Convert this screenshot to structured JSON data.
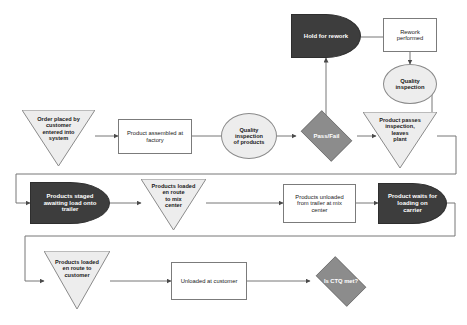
{
  "diagram": {
    "type": "process-flowchart",
    "background_color": "#ffffff",
    "palette": {
      "dark_fill": "#3d3d3d",
      "dark_text": "#ffffff",
      "mid_gray_fill": "#8c8c8c",
      "light_fill": "#ededed",
      "white_fill": "#ffffff",
      "line_color": "#767676",
      "text_color": "#1a1a1a"
    },
    "nodes": [
      {
        "id": "order-placed",
        "label": "Order placed by\ncustomer\nentered into\nsystem",
        "shape": "inverted-triangle",
        "fill": "#ededed"
      },
      {
        "id": "product-assembled",
        "label": "Product assembled at\nfactory",
        "shape": "rectangle",
        "fill": "#ffffff"
      },
      {
        "id": "quality-inspection-products",
        "label": "Quality\ninspection\nof products",
        "shape": "ellipse",
        "fill": "#ededed"
      },
      {
        "id": "pass-fail",
        "label": "Pass/Fail",
        "shape": "diamond",
        "fill": "#8c8c8c"
      },
      {
        "id": "hold-for-rework",
        "label": "Hold for rework",
        "shape": "d-terminator",
        "fill": "#3d3d3d"
      },
      {
        "id": "rework-performed",
        "label": "Rework\nperformed",
        "shape": "rectangle",
        "fill": "#ffffff"
      },
      {
        "id": "quality-inspection",
        "label": "Quality\ninspection",
        "shape": "ellipse",
        "fill": "#ededed"
      },
      {
        "id": "product-passes-inspection",
        "label": "Product passes\ninspection,\nleaves\nplant",
        "shape": "inverted-triangle",
        "fill": "#ededed"
      },
      {
        "id": "products-staged",
        "label": "Products staged\nawaiting load onto\ntrailer",
        "shape": "d-terminator",
        "fill": "#3d3d3d"
      },
      {
        "id": "products-loaded-mix-center",
        "label": "Products loaded\nen route\nto mix\ncenter",
        "shape": "inverted-triangle",
        "fill": "#ededed"
      },
      {
        "id": "products-unloaded-mix-center",
        "label": "Products unloaded\nfrom trailer at mix\ncenter",
        "shape": "rectangle",
        "fill": "#ffffff"
      },
      {
        "id": "product-waits-carrier",
        "label": "Product waits for\nloading on\ncarrier",
        "shape": "d-terminator",
        "fill": "#3d3d3d"
      },
      {
        "id": "products-loaded-customer",
        "label": "Products loaded\nen route to\ncustomer",
        "shape": "inverted-triangle",
        "fill": "#ededed"
      },
      {
        "id": "unloaded-at-customer",
        "label": "Unloaded at customer",
        "shape": "rectangle",
        "fill": "#ffffff"
      },
      {
        "id": "is-ctq-met",
        "label": "Is CTQ met?",
        "shape": "diamond",
        "fill": "#8c8c8c"
      }
    ],
    "edges": [
      {
        "from": "order-placed",
        "to": "product-assembled",
        "arrow": true
      },
      {
        "from": "product-assembled",
        "to": "quality-inspection-products",
        "arrow": false
      },
      {
        "from": "quality-inspection-products",
        "to": "pass-fail",
        "arrow": true
      },
      {
        "from": "pass-fail",
        "to": "hold-for-rework",
        "arrow": true
      },
      {
        "from": "hold-for-rework",
        "to": "rework-performed",
        "arrow": false
      },
      {
        "from": "rework-performed",
        "to": "quality-inspection",
        "arrow": true
      },
      {
        "from": "quality-inspection",
        "to": "product-passes-inspection",
        "arrow": false
      },
      {
        "from": "pass-fail",
        "to": "product-passes-inspection",
        "arrow": true
      },
      {
        "from": "product-passes-inspection",
        "to": "products-staged",
        "arrow": true
      },
      {
        "from": "products-staged",
        "to": "products-loaded-mix-center",
        "arrow": true
      },
      {
        "from": "products-loaded-mix-center",
        "to": "products-unloaded-mix-center",
        "arrow": true
      },
      {
        "from": "products-unloaded-mix-center",
        "to": "product-waits-carrier",
        "arrow": true
      },
      {
        "from": "product-waits-carrier",
        "to": "products-loaded-customer",
        "arrow": true
      },
      {
        "from": "products-loaded-customer",
        "to": "unloaded-at-customer",
        "arrow": true
      },
      {
        "from": "unloaded-at-customer",
        "to": "is-ctq-met",
        "arrow": true
      }
    ]
  }
}
